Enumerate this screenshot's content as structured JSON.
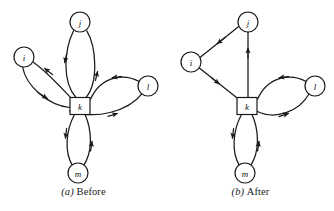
{
  "figure": {
    "type": "diagram",
    "stroke_color": "#1a1a1a",
    "node_fill": "#ffffff"
  },
  "panels": [
    {
      "id": "before",
      "caption_tag": "(a)",
      "caption_text": "Before",
      "nodes": [
        {
          "id": "j",
          "label": "j",
          "shape": "circle",
          "x": 80,
          "y": 22,
          "r": 10
        },
        {
          "id": "i",
          "label": "i",
          "shape": "circle",
          "x": 24,
          "y": 57,
          "r": 10
        },
        {
          "id": "l",
          "label": "l",
          "shape": "circle",
          "x": 148,
          "y": 86,
          "r": 10
        },
        {
          "id": "k",
          "label": "k",
          "shape": "square",
          "x": 80,
          "y": 106,
          "w": 20,
          "h": 17
        },
        {
          "id": "m",
          "label": "m",
          "shape": "circle",
          "x": 78,
          "y": 173,
          "r": 10
        }
      ],
      "edges": [
        {
          "from": "j",
          "to": "k",
          "style": "curved-left"
        },
        {
          "from": "k",
          "to": "j",
          "style": "curved-right"
        },
        {
          "from": "k",
          "to": "i",
          "style": "curved-upper"
        },
        {
          "from": "i",
          "to": "k",
          "style": "curved-lower"
        },
        {
          "from": "l",
          "to": "k",
          "style": "curved-upper"
        },
        {
          "from": "k",
          "to": "l",
          "style": "curved-lower"
        },
        {
          "from": "k",
          "to": "m",
          "style": "curved-left"
        },
        {
          "from": "m",
          "to": "k",
          "style": "curved-right"
        }
      ]
    },
    {
      "id": "after",
      "caption_tag": "(b)",
      "caption_text": "After",
      "nodes": [
        {
          "id": "j",
          "label": "j",
          "shape": "circle",
          "x": 81,
          "y": 22,
          "r": 10
        },
        {
          "id": "i",
          "label": "i",
          "shape": "circle",
          "x": 24,
          "y": 62,
          "r": 10
        },
        {
          "id": "l",
          "label": "l",
          "shape": "circle",
          "x": 148,
          "y": 86,
          "r": 10
        },
        {
          "id": "k",
          "label": "k",
          "shape": "square",
          "x": 80,
          "y": 106,
          "w": 20,
          "h": 17
        },
        {
          "id": "m",
          "label": "m",
          "shape": "circle",
          "x": 78,
          "y": 173,
          "r": 10
        }
      ],
      "edges": [
        {
          "from": "j",
          "to": "i",
          "style": "straight"
        },
        {
          "from": "i",
          "to": "k",
          "style": "straight"
        },
        {
          "from": "k",
          "to": "j",
          "style": "straight"
        },
        {
          "from": "l",
          "to": "k",
          "style": "curved-upper"
        },
        {
          "from": "k",
          "to": "l",
          "style": "curved-lower"
        },
        {
          "from": "k",
          "to": "m",
          "style": "curved-left"
        },
        {
          "from": "m",
          "to": "k",
          "style": "curved-right"
        }
      ]
    }
  ]
}
